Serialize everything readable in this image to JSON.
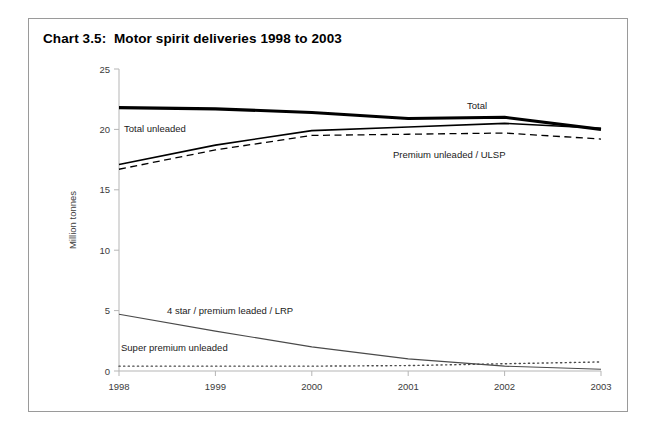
{
  "figure": {
    "title": "Chart 3.5:  Motor spirit deliveries 1998 to 2003",
    "border_color": "#9a9a9a"
  },
  "chart_data": {
    "type": "line",
    "title": "Chart 3.5:  Motor spirit deliveries 1998 to 2003",
    "xlabel": "",
    "ylabel": "Million tonnes",
    "x": [
      1998,
      1999,
      2000,
      2001,
      2002,
      2003
    ],
    "xlim": [
      1998,
      2003
    ],
    "ylim": [
      0,
      25
    ],
    "yticks": [
      0,
      5,
      10,
      15,
      20,
      25
    ],
    "ytick_labels": [
      "0",
      "5",
      "10",
      "15",
      "20",
      "25"
    ],
    "xticks": [
      1998,
      1999,
      2000,
      2001,
      2002,
      2003
    ],
    "xtick_labels": [
      "1998",
      "1999",
      "2000",
      "2001",
      "2002",
      "2003"
    ],
    "grid": false,
    "legend": "inline-annotations",
    "series": [
      {
        "name": "Total",
        "label": "Total",
        "style": "solid-thick",
        "color": "#000000",
        "values": [
          21.8,
          21.7,
          21.4,
          20.9,
          21.0,
          20.0
        ]
      },
      {
        "name": "Total unleaded",
        "label": "Total unleaded",
        "style": "solid-medium",
        "color": "#000000",
        "values": [
          17.1,
          18.7,
          19.9,
          20.2,
          20.5,
          20.1
        ]
      },
      {
        "name": "Premium unleaded / ULSP",
        "label": "Premium unleaded /  ULSP",
        "style": "dashed",
        "color": "#000000",
        "values": [
          16.7,
          18.3,
          19.5,
          19.6,
          19.7,
          19.2
        ]
      },
      {
        "name": "4 star / premium leaded / LRP",
        "label": "4 star / premium leaded / LRP",
        "style": "solid-thin",
        "color": "#4a4a4a",
        "values": [
          4.7,
          3.3,
          2.0,
          1.0,
          0.4,
          0.15
        ]
      },
      {
        "name": "Super premium unleaded",
        "label": "Super premium unleaded",
        "style": "dotted",
        "color": "#4a4a4a",
        "values": [
          0.4,
          0.4,
          0.4,
          0.45,
          0.6,
          0.75
        ]
      }
    ],
    "annotations": [
      {
        "id": "total",
        "text": "Total",
        "x_px": 466,
        "y_px": 108
      },
      {
        "id": "total-unleaded",
        "text": "Total unleaded",
        "x_px": 123,
        "y_px": 131
      },
      {
        "id": "premium-ulsp",
        "text": "Premium unleaded /  ULSP",
        "x_px": 392,
        "y_px": 157
      },
      {
        "id": "four-star",
        "text": "4 star / premium leaded / LRP",
        "x_px": 166,
        "y_px": 313
      },
      {
        "id": "super-premium",
        "text": "Super premium unleaded",
        "x_px": 120,
        "y_px": 350
      }
    ]
  }
}
